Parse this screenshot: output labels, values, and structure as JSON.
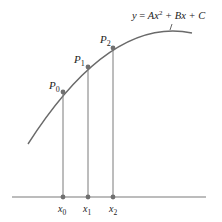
{
  "diagram": {
    "equation": {
      "y": "y",
      "eq": " = ",
      "A": "Ax",
      "exp": "2",
      "rest": " + Bx + C"
    },
    "points": [
      {
        "label": "P",
        "sub": "0",
        "x": 63,
        "y": 92
      },
      {
        "label": "P",
        "sub": "1",
        "x": 88,
        "y": 67
      },
      {
        "label": "P",
        "sub": "2",
        "x": 113,
        "y": 48
      }
    ],
    "axis_ticks": [
      {
        "label": "x",
        "sub": "0",
        "x": 63
      },
      {
        "label": "x",
        "sub": "1",
        "x": 88
      },
      {
        "label": "x",
        "sub": "2",
        "x": 113
      }
    ],
    "colors": {
      "curve": "#6a6a6a",
      "lines": "#7a7a7a",
      "points": "#707070",
      "text": "#222222"
    }
  }
}
